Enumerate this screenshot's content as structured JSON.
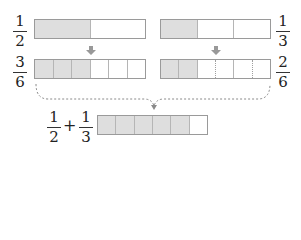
{
  "rows": {
    "top_left": {
      "numerator": "1",
      "denominator": "2",
      "parts": 2,
      "shaded": 1
    },
    "top_right": {
      "numerator": "1",
      "denominator": "3",
      "parts": 3,
      "shaded": 1
    },
    "mid_left": {
      "numerator": "3",
      "denominator": "6",
      "parts": 6,
      "shaded": 3
    },
    "mid_right": {
      "numerator": "2",
      "denominator": "6",
      "parts": 6,
      "shaded": 2
    }
  },
  "sum": {
    "a_numerator": "1",
    "a_denominator": "2",
    "operator": "+",
    "b_numerator": "1",
    "b_denominator": "3",
    "parts": 6,
    "shaded": 5
  },
  "colors": {
    "shade": "#dedede",
    "border": "#9a9a9a",
    "arrow": "#999999",
    "brace": "#8a8a8a"
  }
}
